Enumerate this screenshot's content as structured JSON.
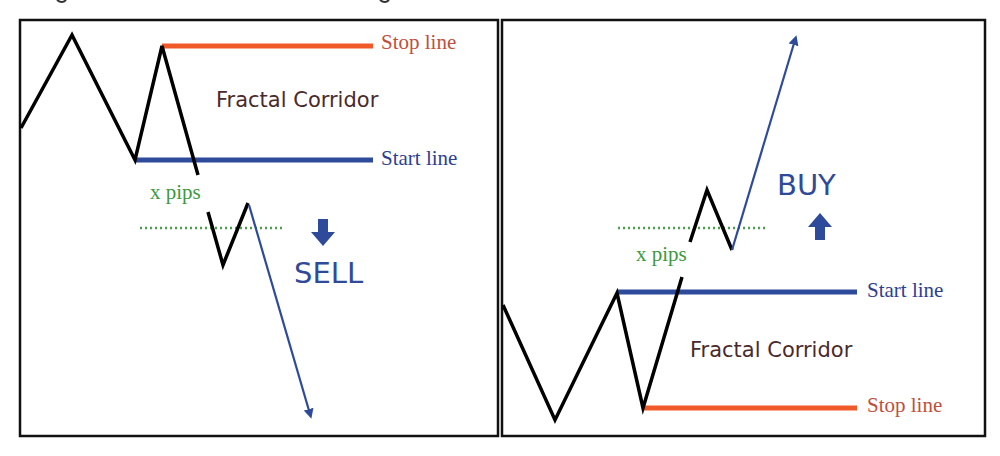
{
  "colors": {
    "stop_line": "#f05a28",
    "start_line": "#2e4a9a",
    "price": "#000000",
    "trend_arrow": "#2e4a9a",
    "threshold": "#4aa04a",
    "stop_text": "#c0503c",
    "start_text": "#2f3f8f",
    "pips_text": "#3c9a3c",
    "action_text": "#2f4a99"
  },
  "left_panel": {
    "stop_label": "Stop line",
    "corridor_label": "Fractal Corridor",
    "start_label": "Start line",
    "pips_label": "x pips",
    "action_label": "SELL",
    "action_icon": "arrow-down-icon"
  },
  "right_panel": {
    "stop_label": "Stop line",
    "corridor_label": "Fractal Corridor",
    "start_label": "Start line",
    "pips_label": "x pips",
    "action_label": "BUY",
    "action_icon": "arrow-up-icon"
  }
}
